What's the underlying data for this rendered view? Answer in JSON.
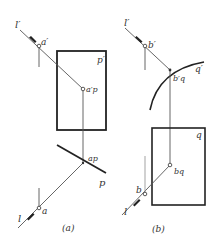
{
  "figure_a": {
    "caption": "(a)",
    "labels": {
      "l_prime": "l′",
      "a_prime": "a′",
      "plane_p_prime": "p′",
      "a_p_prime": "a′p",
      "a_p": "ap",
      "plane_p": "p",
      "a": "a",
      "l": "l"
    }
  },
  "figure_b": {
    "caption": "(b)",
    "labels": {
      "l_prime": "l′",
      "b_prime": "b′",
      "surface_q_prime": "q′",
      "b_q_prime": "b′q",
      "surface_q": "q",
      "b_q": "bq",
      "b": "b",
      "l": "l"
    }
  },
  "colors": {
    "line": "#444444",
    "thick": "#222222",
    "text": "#333333"
  }
}
